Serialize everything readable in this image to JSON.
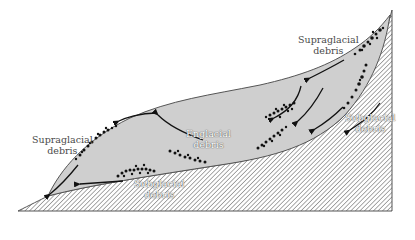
{
  "diagram": {
    "type": "glacier cross-section",
    "colors": {
      "background": "#ffffff",
      "glacier_ice": "#cfcfcf",
      "bedrock_hatch": "#555555",
      "outline": "#555555",
      "debris": "#111111",
      "arrows": "#111111",
      "label_text": "#4a4a4a"
    },
    "labels": {
      "supraglacial_upper": {
        "line1": "Supraglacial",
        "line2": "debris"
      },
      "supraglacial_lower": {
        "line1": "Supraglacial",
        "line2": "debris"
      },
      "englacial": {
        "line1": "Englacial",
        "line2": "debris"
      },
      "subglacial_right": {
        "line1": "Subglacial",
        "line2": "debris"
      },
      "subglacial_lower": {
        "line1": "Subglacial",
        "line2": "debris"
      }
    },
    "regions": [
      {
        "name": "glacier ice",
        "fill": "light gray"
      },
      {
        "name": "bedrock",
        "fill": "diagonal hatching"
      }
    ],
    "icons": [
      "flow-arrow",
      "debris-dots"
    ]
  }
}
